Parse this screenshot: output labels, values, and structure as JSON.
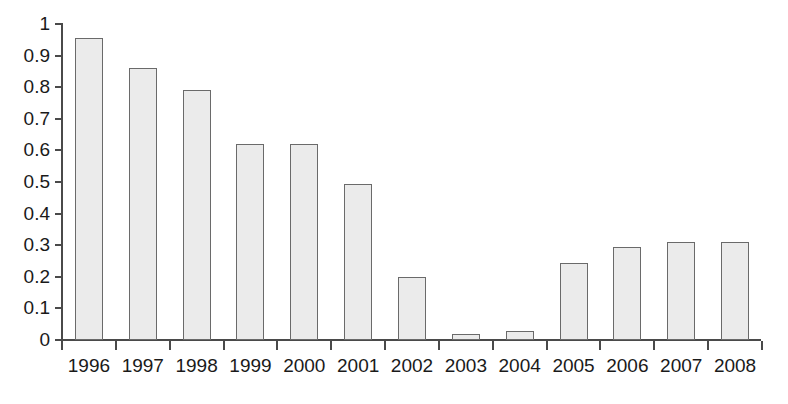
{
  "chart_data": {
    "type": "bar",
    "title": "",
    "subtitle": "",
    "xlabel": "",
    "ylabel": "",
    "categories": [
      "1996",
      "1997",
      "1998",
      "1999",
      "2000",
      "2001",
      "2002",
      "2003",
      "2004",
      "2005",
      "2006",
      "2007",
      "2008"
    ],
    "values": [
      0.955,
      0.86,
      0.79,
      0.62,
      0.62,
      0.495,
      0.198,
      0.018,
      0.028,
      0.243,
      0.294,
      0.31,
      0.31
    ],
    "series": [
      {
        "name": "",
        "values": [
          0.955,
          0.86,
          0.79,
          0.62,
          0.62,
          0.495,
          0.198,
          0.018,
          0.028,
          0.243,
          0.294,
          0.31,
          0.31
        ]
      }
    ],
    "ylim": [
      0,
      1
    ],
    "ytick_labels": [
      "1",
      "0.9",
      "0.8",
      "0.7",
      "0.6",
      "0.5",
      "0.4",
      "0.3",
      "0.2",
      "0.1",
      "0"
    ],
    "ytick_values": [
      1,
      0.9,
      0.8,
      0.7,
      0.6,
      0.5,
      0.4,
      0.3,
      0.2,
      0.1,
      0
    ],
    "xtick_labels": [
      "1996",
      "1997",
      "1998",
      "1999",
      "2000",
      "2001",
      "2002",
      "2003",
      "2004",
      "2005",
      "2006",
      "2007",
      "2008"
    ],
    "grid": false,
    "legend": "none",
    "annotations": [],
    "colors": {
      "bar_fill": "#ebebeb",
      "bar_border": "#6a6a6a",
      "axis": "#4a4a4a",
      "text": "#1a1a1a",
      "background": "#ffffff"
    }
  }
}
